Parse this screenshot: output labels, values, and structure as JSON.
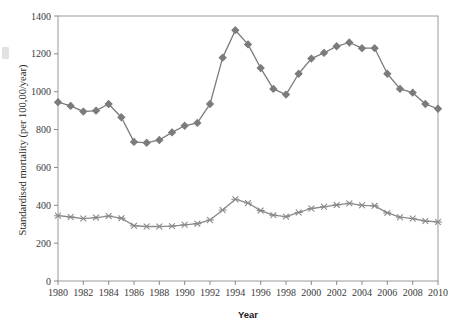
{
  "chart_data": {
    "type": "line",
    "title": "",
    "xlabel": "Year",
    "ylabel": "Standardised mortality (per 100,00/year)",
    "xlim": [
      1980,
      2010
    ],
    "ylim": [
      0,
      1400
    ],
    "grid": false,
    "legend_position": "none",
    "xticks": [
      1980,
      1982,
      1984,
      1986,
      1988,
      1990,
      1992,
      1994,
      1996,
      1998,
      2000,
      2002,
      2004,
      2006,
      2008,
      2010
    ],
    "xtick_labels": [
      "1980",
      "1982",
      "1984",
      "1986",
      "1988",
      "1990",
      "1992",
      "1994",
      "1996",
      "1998",
      "2000",
      "2002",
      "2004",
      "2006",
      "2008",
      "2010"
    ],
    "yticks": [
      0,
      200,
      400,
      600,
      800,
      1000,
      1200,
      1400
    ],
    "ytick_labels": [
      "0",
      "200",
      "400",
      "600",
      "800",
      "1000",
      "1200",
      "1400"
    ],
    "x": [
      1980,
      1981,
      1982,
      1983,
      1984,
      1985,
      1986,
      1987,
      1988,
      1989,
      1990,
      1991,
      1992,
      1993,
      1994,
      1995,
      1996,
      1997,
      1998,
      1999,
      2000,
      2001,
      2002,
      2003,
      2004,
      2005,
      2006,
      2007,
      2008,
      2009,
      2010
    ],
    "series": [
      {
        "name": "upper-series",
        "marker": "diamond",
        "color": "#7b7b7b",
        "values": [
          945,
          925,
          895,
          900,
          935,
          865,
          735,
          730,
          745,
          785,
          820,
          835,
          935,
          1180,
          1325,
          1250,
          1125,
          1015,
          985,
          1095,
          1175,
          1205,
          1240,
          1260,
          1230,
          1230,
          1095,
          1015,
          995,
          935,
          910
        ]
      },
      {
        "name": "lower-series",
        "marker": "asterisk",
        "color": "#8a8a8a",
        "values": [
          345,
          338,
          330,
          335,
          343,
          332,
          292,
          288,
          288,
          290,
          297,
          303,
          322,
          375,
          432,
          412,
          372,
          348,
          340,
          362,
          383,
          392,
          402,
          410,
          400,
          397,
          360,
          337,
          330,
          317,
          312
        ]
      }
    ]
  },
  "axes": {
    "x_title": "Year",
    "y_title": "Standardised mortality (per 100,00/year)"
  }
}
